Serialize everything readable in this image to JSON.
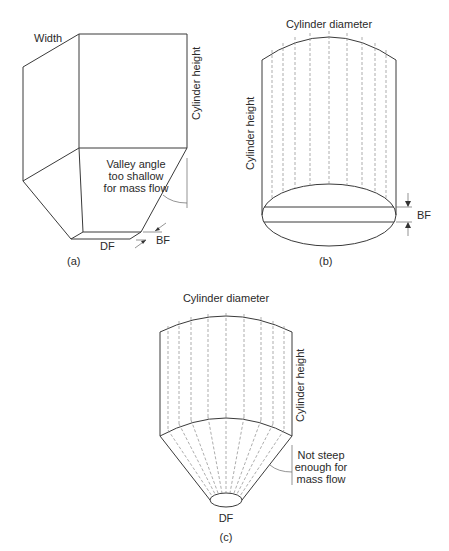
{
  "figure_a": {
    "caption": "(a)",
    "caption_letter": "a",
    "labels": {
      "width": "Width",
      "cylinder_height": "Cylinder height",
      "valley_line1": "Valley angle",
      "valley_line2": "too shallow",
      "valley_line3": "for mass flow",
      "df": "DF",
      "bf": "BF"
    }
  },
  "figure_b": {
    "caption": "(b)",
    "labels": {
      "cylinder_diameter": "Cylinder diameter",
      "cylinder_height": "Cylinder height",
      "bf": "BF"
    }
  },
  "figure_c": {
    "caption": "(c)",
    "labels": {
      "cylinder_diameter": "Cylinder diameter",
      "cylinder_height": "Cylinder height",
      "not_steep_line1": "Not steep",
      "not_steep_line2": "enough for",
      "not_steep_line3": "mass flow",
      "df": "DF"
    }
  }
}
